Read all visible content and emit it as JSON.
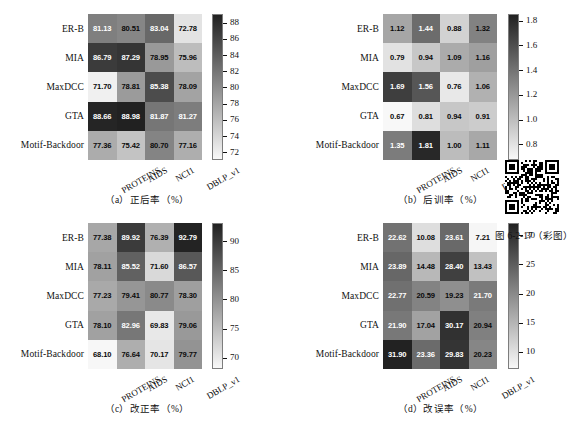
{
  "figure": {
    "label": "图 6-2-17（彩图）",
    "qr_alt": "qr-code"
  },
  "rows": [
    "ER-B",
    "MIA",
    "MaxDCC",
    "GTA",
    "Motif-Backdoor"
  ],
  "cols": [
    "PROTEINS",
    "AIDS",
    "NCI1",
    "DBLP_v1"
  ],
  "chart_data": [
    {
      "type": "heatmap",
      "panel": "a",
      "title": "（a）正后率（%）",
      "xlabel": "",
      "ylabel": "",
      "categories_x": [
        "PROTEINS",
        "AIDS",
        "NCI1",
        "DBLP_v1"
      ],
      "categories_y": [
        "ER-B",
        "MIA",
        "MaxDCC",
        "GTA",
        "Motif-Backdoor"
      ],
      "values": [
        [
          81.13,
          80.51,
          83.04,
          72.78
        ],
        [
          86.79,
          87.29,
          78.95,
          75.96
        ],
        [
          71.7,
          78.81,
          85.38,
          78.09
        ],
        [
          88.66,
          88.98,
          81.87,
          81.27
        ],
        [
          77.36,
          75.42,
          80.7,
          77.16
        ]
      ],
      "clim": [
        71.0,
        89.0
      ],
      "cbar_ticks": [
        72,
        74,
        76,
        78,
        80,
        82,
        84,
        86,
        88
      ],
      "cbar_tick_labels": [
        "72",
        "74",
        "76",
        "78",
        "80",
        "82",
        "84",
        "86",
        "88"
      ],
      "colormap": "gray-reversed",
      "grid": false,
      "legend": "colorbar-right"
    },
    {
      "type": "heatmap",
      "panel": "b",
      "title": "（b）后训率（%）",
      "xlabel": "",
      "ylabel": "",
      "categories_x": [
        "PROTEINS",
        "AIDS",
        "NCI1",
        "DBLP_v1"
      ],
      "categories_y": [
        "ER-B",
        "MIA",
        "MaxDCC",
        "GTA",
        "Motif-Backdoor"
      ],
      "values": [
        [
          1.12,
          1.44,
          0.88,
          1.32
        ],
        [
          0.79,
          0.94,
          1.09,
          1.16
        ],
        [
          1.69,
          1.56,
          0.76,
          1.06
        ],
        [
          0.67,
          0.81,
          0.94,
          0.91
        ],
        [
          1.35,
          1.81,
          1.0,
          1.11
        ]
      ],
      "clim": [
        0.67,
        1.85
      ],
      "cbar_ticks": [
        0.8,
        1.0,
        1.2,
        1.4,
        1.6,
        1.8
      ],
      "cbar_tick_labels": [
        "0.8",
        "1.0",
        "1.2",
        "1.4",
        "1.6",
        "1.8"
      ],
      "colormap": "gray-reversed",
      "grid": false,
      "legend": "colorbar-right"
    },
    {
      "type": "heatmap",
      "panel": "c",
      "title": "（c）改正率（%）",
      "xlabel": "",
      "ylabel": "",
      "categories_x": [
        "PROTEINS",
        "AIDS",
        "NCI1",
        "DBLP_v1"
      ],
      "categories_y": [
        "ER-B",
        "MIA",
        "MaxDCC",
        "GTA",
        "Motif-Backdoor"
      ],
      "values": [
        [
          77.38,
          89.92,
          76.39,
          92.79
        ],
        [
          78.11,
          85.52,
          71.6,
          86.57
        ],
        [
          77.23,
          79.41,
          80.77,
          78.3
        ],
        [
          78.1,
          82.96,
          69.83,
          79.06
        ],
        [
          68.1,
          76.64,
          70.17,
          79.77
        ]
      ],
      "clim": [
        68.0,
        93.0
      ],
      "cbar_ticks": [
        70,
        75,
        80,
        85,
        90
      ],
      "cbar_tick_labels": [
        "70",
        "75",
        "80",
        "85",
        "90"
      ],
      "colormap": "gray-reversed",
      "grid": false,
      "legend": "colorbar-right"
    },
    {
      "type": "heatmap",
      "panel": "d",
      "title": "（d）改误率（%）",
      "xlabel": "",
      "ylabel": "",
      "categories_x": [
        "PROTEINS",
        "AIDS",
        "NCI1",
        "DBLP_v1"
      ],
      "categories_y": [
        "ER-B",
        "MIA",
        "MaxDCC",
        "GTA",
        "Motif-Backdoor"
      ],
      "values": [
        [
          22.62,
          10.08,
          23.61,
          7.21
        ],
        [
          23.89,
          14.48,
          28.4,
          13.43
        ],
        [
          22.77,
          20.59,
          19.23,
          21.7
        ],
        [
          21.9,
          17.04,
          30.17,
          20.94
        ],
        [
          31.9,
          23.36,
          29.83,
          20.23
        ]
      ],
      "clim": [
        7.0,
        32.0
      ],
      "cbar_ticks": [
        10,
        15,
        20,
        25,
        30
      ],
      "cbar_tick_labels": [
        "10",
        "15",
        "20",
        "25",
        "30"
      ],
      "colormap": "gray-reversed",
      "grid": false,
      "legend": "colorbar-right"
    }
  ]
}
